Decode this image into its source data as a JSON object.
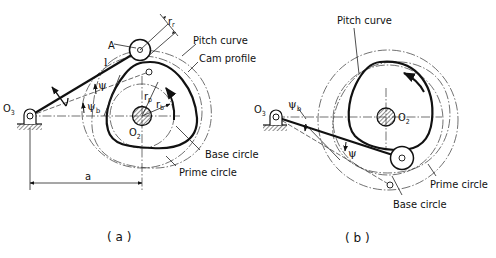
{
  "figure": {
    "panel_a": {
      "caption": "( a )",
      "labels": {
        "pitch_curve": "Pitch curve",
        "cam_profile": "Cam profile",
        "base_circle": "Base circle",
        "prime_circle": "Prime circle",
        "point_a": "A",
        "arm_length": "l",
        "roller_radius": "r",
        "roller_radius_sub": "r",
        "pivot": "O",
        "pivot_sub": "3",
        "cam_center": "O",
        "cam_center_sub": "2",
        "psi": "ψ",
        "psi_b": "ψ",
        "psi_b_sub": "b",
        "r_p": "r",
        "r_p_sub": "p",
        "r_b": "r",
        "r_b_sub": "b",
        "center_distance": "a"
      }
    },
    "panel_b": {
      "caption": "( b )",
      "labels": {
        "pitch_curve": "Pitch curve",
        "base_circle": "Base circle",
        "prime_circle": "Prime circle",
        "pivot": "O",
        "pivot_sub": "3",
        "cam_center": "O",
        "cam_center_sub": "2",
        "psi": "ψ",
        "psi_b": "ψ",
        "psi_b_sub": "b"
      }
    }
  }
}
